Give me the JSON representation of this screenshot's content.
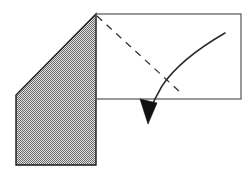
{
  "canvas": {
    "width": 249,
    "height": 180,
    "background": "#ffffff",
    "title": "Paper fold diagram"
  },
  "colors": {
    "stroke": "#1a1a1a",
    "rectangle_stroke": "#555555",
    "shade_light": "#c9c9c9",
    "shade_dark": "#6e6e6e",
    "arrow_fill": "#111111",
    "background": "#ffffff"
  },
  "shapes": {
    "shaded_polygon": {
      "label": "Shaded folded flap",
      "points": "96,14 96,165 16,165 16,95",
      "fill_pattern": "checker-stipple",
      "stroke_width": 1.4
    },
    "rectangle": {
      "label": "Unfolded panel outline",
      "x": 96,
      "y": 14,
      "width": 145,
      "height": 85,
      "stroke_width": 1.2,
      "fill": "none"
    },
    "fold_line": {
      "label": "Dashed fold crease",
      "x1": 97,
      "y1": 16,
      "x2": 179,
      "y2": 91,
      "dash": "7 6",
      "stroke_width": 1.3
    },
    "motion_arc": {
      "label": "Curved motion arrow shaft",
      "path": "M 225 33 C 206 44, 178 62, 162 86 C 156 96, 152 105, 149 113",
      "stroke_width": 1.5
    },
    "arrow_head": {
      "label": "Arrowhead pointing down",
      "points": "148,124 140,99 157,103",
      "fill": "#111111"
    }
  },
  "annotations": {
    "diagram_type": "geometric-fold-illustration",
    "element_count": 5
  }
}
